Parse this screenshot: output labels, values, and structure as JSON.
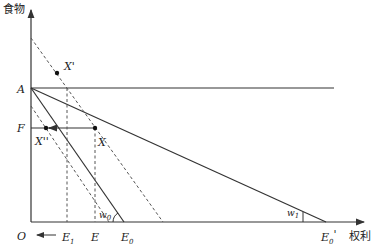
{
  "axes": {
    "y_label": "食物",
    "x_label": "权利",
    "origin_label": "O"
  },
  "points": {
    "A": "A",
    "F": "F",
    "X_prime": "X'",
    "X": "X",
    "X_double_prime": "X''",
    "E1": "E",
    "E1_sub": "1",
    "E": "E",
    "E0": "E",
    "E0_sub": "0",
    "E0_prime": "E",
    "E0_prime_sub": "0",
    "E0_prime_mark": "'"
  },
  "angles": {
    "w0": "w",
    "w0_sub": "0",
    "w0_mark": "'",
    "w1": "w",
    "w1_sub": "1",
    "w1_mark": "'"
  },
  "colors": {
    "line": "#333333",
    "dashed": "#555555",
    "background": "#ffffff"
  }
}
